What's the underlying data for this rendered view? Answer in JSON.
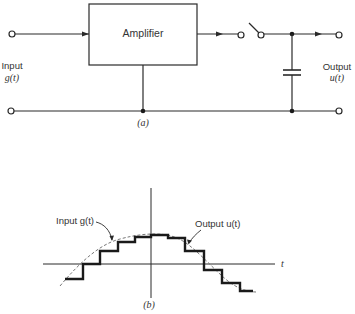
{
  "circuit": {
    "amplifier_label": "Amplifier",
    "input_label": "Input",
    "input_signal": "g(t)",
    "output_label": "Output",
    "output_signal": "u(t)",
    "caption": "(a)"
  },
  "plot": {
    "input_label": "Input g(t)",
    "output_label": "Output u(t)",
    "axis_label": "t",
    "caption": "(b)"
  }
}
